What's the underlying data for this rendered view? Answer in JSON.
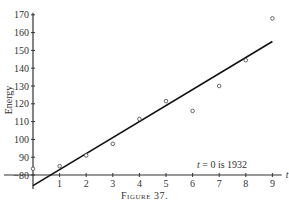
{
  "chart_data": {
    "type": "scatter",
    "title": "",
    "caption": "Figure 37.",
    "xlabel": "t",
    "ylabel": "Energy",
    "annotation": "t = 0 is 1932",
    "xlim": [
      0,
      9.3
    ],
    "ylim": [
      80,
      170
    ],
    "x_ticks": [
      1,
      2,
      3,
      4,
      5,
      6,
      7,
      8,
      9
    ],
    "y_ticks": [
      80,
      90,
      100,
      110,
      120,
      130,
      140,
      150,
      160,
      170
    ],
    "grid": false,
    "legend": null,
    "series": [
      {
        "name": "observed",
        "kind": "points",
        "marker": "open-circle",
        "x": [
          0,
          1,
          2,
          3,
          4,
          5,
          6,
          7,
          8,
          9
        ],
        "y": [
          83.5,
          85,
          91,
          97.5,
          111.5,
          121.5,
          116,
          130,
          144.5,
          168
        ]
      },
      {
        "name": "fitted line",
        "kind": "line",
        "x": [
          0,
          9
        ],
        "y": [
          74,
          155
        ]
      }
    ]
  },
  "caption": {
    "label": "Figure",
    "number": "37."
  }
}
